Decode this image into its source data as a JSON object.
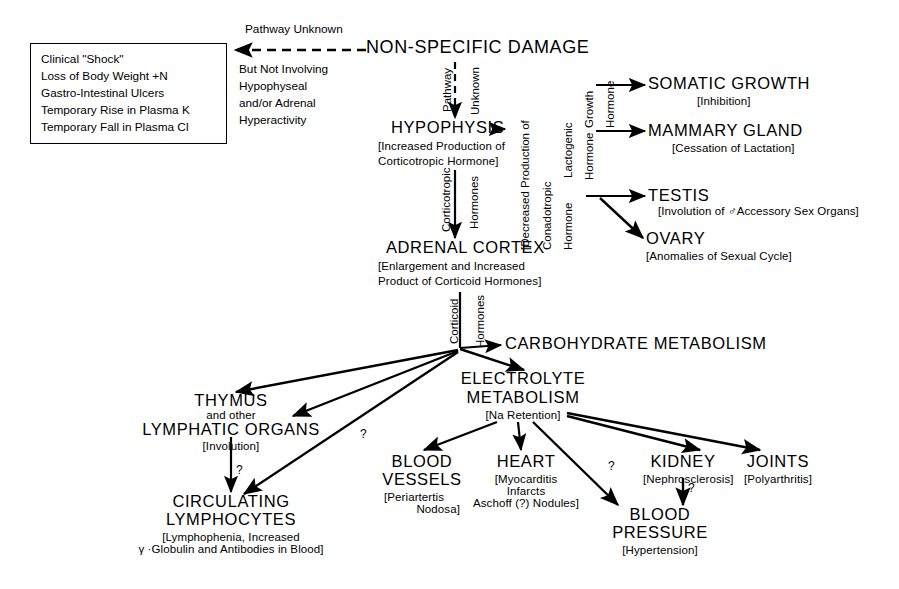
{
  "diagram": {
    "line_color": "#000000",
    "background": "#ffffff"
  },
  "shock_box": {
    "name": "clinical-shock-box",
    "lines": [
      "Clinical \"Shock\"",
      "Loss of Body Weight +N",
      "Gastro-Intestinal Ulcers",
      "Temporary Rise in  Plasma K",
      "Temporary Fall in Plasma Cl"
    ]
  },
  "pathway_note": {
    "heading": "Pathway Unknown",
    "lines": [
      "But Not Involving",
      "Hypophyseal",
      "and/or Adrenal",
      "Hyperactivity"
    ]
  },
  "nodes": {
    "non_specific_damage": {
      "title": "NON-SPECIFIC DAMAGE",
      "sub": ""
    },
    "hypophysis": {
      "title": "HYPOPHYSIS",
      "sub_lines": [
        "[Increased Production of",
        "Corticotropic Hormone]"
      ]
    },
    "adrenal_cortex": {
      "title": "ADRENAL CORTEX",
      "sub_lines": [
        "[Enlargement and Increased",
        "Product of Corticoid Hormones]"
      ]
    },
    "somatic_growth": {
      "title": "SOMATIC GROWTH",
      "sub_lines": [
        "[Inhibition]"
      ]
    },
    "mammary_gland": {
      "title": "MAMMARY GLAND",
      "sub_lines": [
        "[Cessation of Lactation]"
      ]
    },
    "testis": {
      "title": "TESTIS",
      "sub_lines": [
        "[Involution of ♂Accessory Sex Organs]"
      ]
    },
    "ovary": {
      "title": "OVARY",
      "sub_lines": [
        "[Anomalies of Sexual Cycle]"
      ]
    },
    "carbohydrate_metabolism": {
      "title": "CARBOHYDRATE  METABOLISM",
      "sub_lines": []
    },
    "electrolyte_metabolism": {
      "title_lines": [
        "ELECTROLYTE",
        "METABOLISM"
      ],
      "sub_lines": [
        "[Na Retention]"
      ]
    },
    "thymus": {
      "title_lines": [
        "THYMUS",
        "and other",
        "LYMPHATIC ORGANS"
      ],
      "sub_lines": [
        "[Involution]"
      ]
    },
    "circulating_lymphocytes": {
      "title_lines": [
        "CIRCULATING",
        "LYMPHOCYTES"
      ],
      "sub_lines": [
        "[Lymphophenia, Increased",
        "γ ·Globulin and Antibodies in Blood]"
      ]
    },
    "blood_vessels": {
      "title_lines": [
        "BLOOD",
        "VESSELS"
      ],
      "sub_lines": [
        "[Periartertis",
        "Nodosa]"
      ]
    },
    "heart": {
      "title_lines": [
        "HEART"
      ],
      "sub_lines": [
        "[Myocarditis",
        "Infarcts",
        "Aschoff (?) Nodules]"
      ]
    },
    "kidney": {
      "title": "KIDNEY",
      "sub_lines": [
        "[Nephrosclerosis]"
      ]
    },
    "joints": {
      "title": "JOINTS",
      "sub_lines": [
        "[Polyarthritis]"
      ]
    },
    "blood_pressure": {
      "title_lines": [
        "BLOOD",
        "PRESSURE"
      ],
      "sub_lines": [
        "[Hypertension]"
      ]
    }
  },
  "edge_labels": {
    "pathway": "Pathway",
    "unknown": "Unknown",
    "corticotropic": "Corticotropic",
    "hormones_1": "Hormones",
    "decreased_production": "[Decreased Production of",
    "conadotropic": "Conadotropic",
    "lactogenic": "Lactogenic",
    "growth": "Growth",
    "hormone_gonadotropic": "Hormone",
    "hormone_lactogenic": "Hormone",
    "hormone_growth": "Hormone",
    "corticoid": "Corticoid",
    "hormones_2": "Hormones",
    "q_thymus": "?",
    "q_lymphocytes": "?",
    "q_kidney_bp": "?",
    "q_electrolyte_bp": "?"
  }
}
